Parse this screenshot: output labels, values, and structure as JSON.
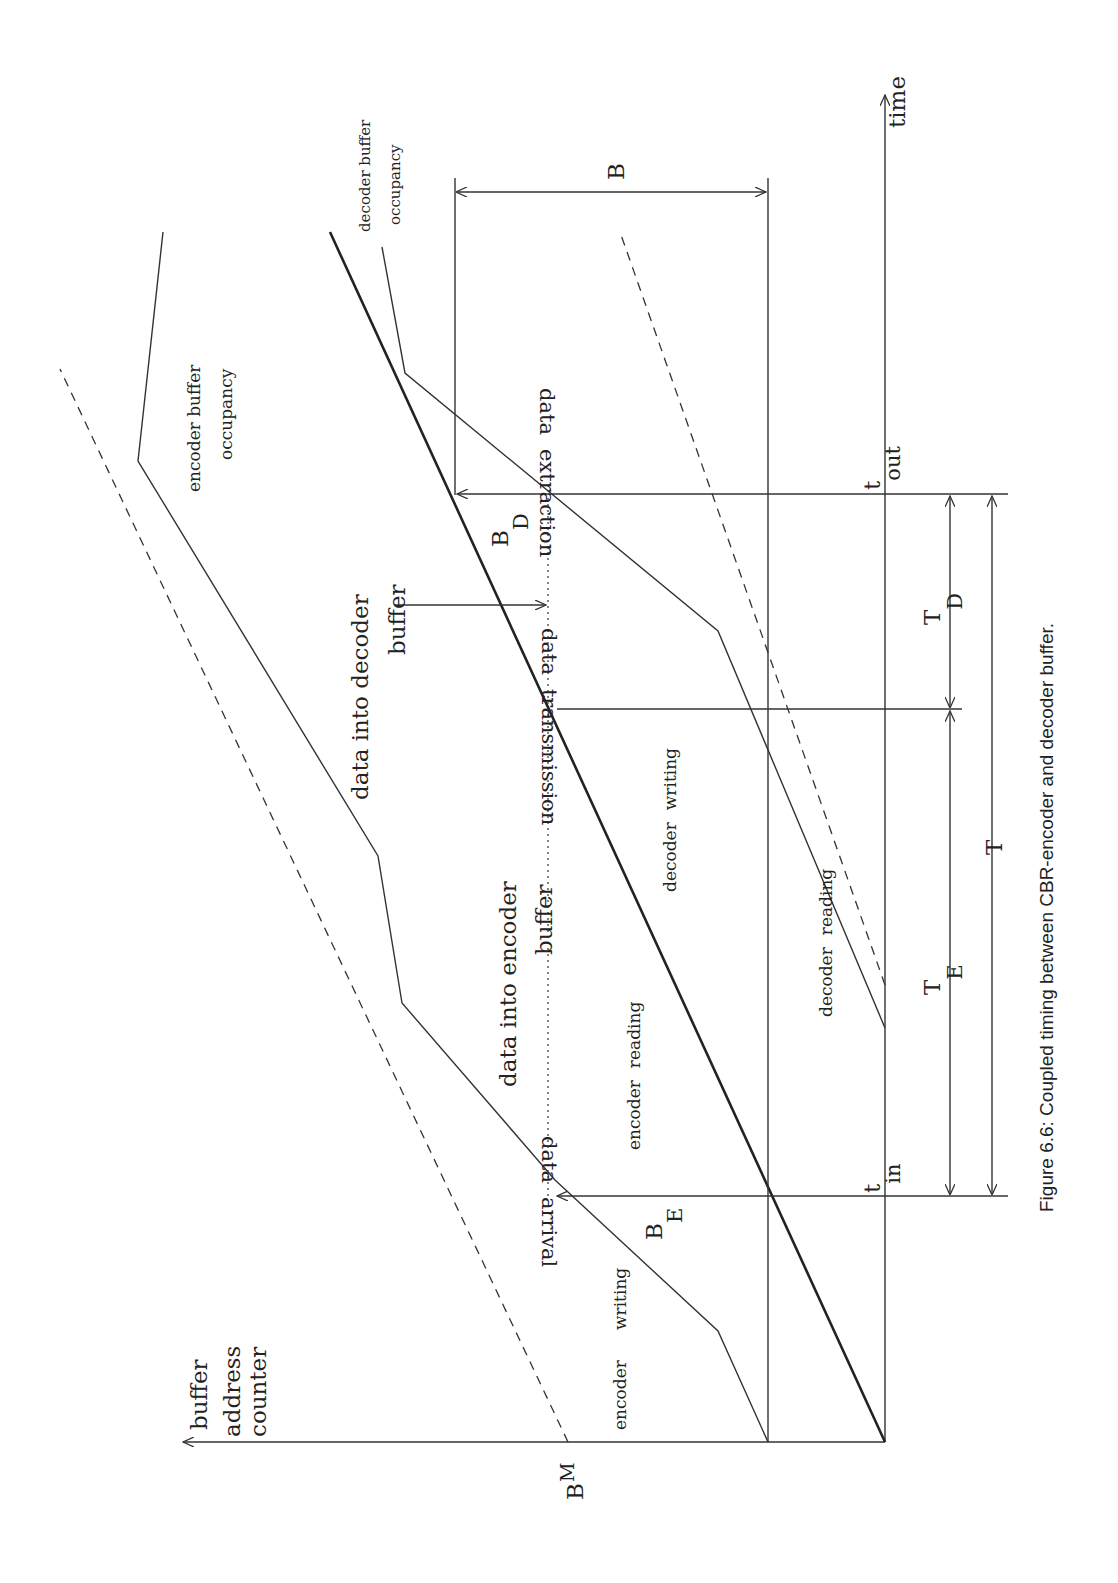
{
  "figure": {
    "caption": "Figure 6.6:  Coupled timing between CBR-encoder and decoder buffer.",
    "orientation": "rotated 90 degrees counter-clockwise (landscape on portrait page)"
  },
  "axes": {
    "x_label": "time",
    "y_label_line1": "buffer",
    "y_label_line2": "address",
    "y_label_line3": "counter",
    "y_marker": "B",
    "y_marker_sub": "M"
  },
  "labels": {
    "encoder_writing_1": "encoder",
    "encoder_writing_2": "writing",
    "data_arrival_1": "data",
    "data_arrival_2": "arrival",
    "be": "B",
    "be_sub": "E",
    "data_into_encoder_1": "data  into  encoder",
    "data_into_encoder_2": "buffer",
    "encoder_reading_1": "encoder",
    "encoder_reading_2": "reading",
    "decoder_writing_1": "decoder",
    "decoder_writing_2": "writing",
    "decoder_reading_1": "decoder",
    "decoder_reading_2": "reading",
    "data_transmission_1": "data",
    "data_transmission_2": "transmission",
    "data_into_decoder_1": "data  into  decoder",
    "data_into_decoder_2": "buffer",
    "bd": "B",
    "bd_sub": "D",
    "data_extraction_1": "data",
    "data_extraction_2": "extraction",
    "encoder_buffer_occ_1": "encoder  buffer",
    "encoder_buffer_occ_2": "occupancy",
    "decoder_buffer_occ_1": "decoder  buffer",
    "decoder_buffer_occ_2": "occupancy",
    "b": "B",
    "t_in": "t",
    "t_in_sub": "in",
    "t_out": "t",
    "t_out_sub": "out",
    "te": "T",
    "te_sub": "E",
    "td": "T",
    "td_sub": "D",
    "t": "T"
  }
}
